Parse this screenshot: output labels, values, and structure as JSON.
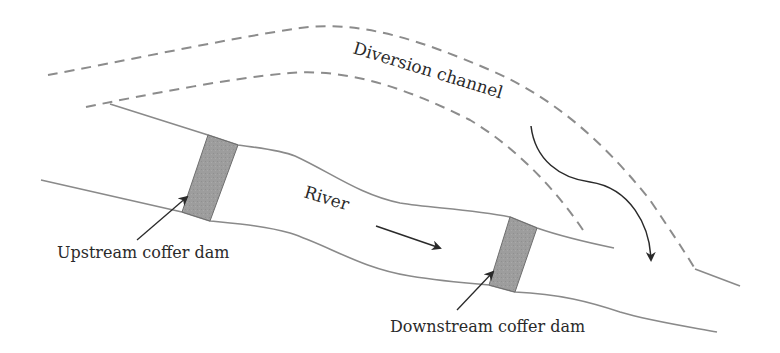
{
  "diagram": {
    "type": "river-diversion-schematic",
    "labels": {
      "diversion_channel": "Diversion channel",
      "river": "River",
      "upstream_dam": "Upstream coffer dam",
      "downstream_dam": "Downstream coffer dam"
    },
    "colors": {
      "bank_line": "#8a8a8a",
      "dashed_channel": "#8c8c8c",
      "dam_fill": "#9b9b9b",
      "dam_stroke": "#6e6e6e",
      "arrow": "#2a2a2a",
      "text": "#2a2a2a"
    },
    "elements": [
      {
        "name": "diversion-channel-outer-edge",
        "style": "dashed"
      },
      {
        "name": "diversion-channel-inner-edge",
        "style": "dashed"
      },
      {
        "name": "river-upper-bank",
        "style": "solid"
      },
      {
        "name": "river-lower-bank",
        "style": "solid"
      },
      {
        "name": "upstream-coffer-dam",
        "style": "filled-block"
      },
      {
        "name": "downstream-coffer-dam",
        "style": "filled-block"
      },
      {
        "name": "river-flow-arrow",
        "style": "straight-arrow"
      },
      {
        "name": "diversion-flow-arrow",
        "style": "curved-arrow"
      }
    ]
  }
}
